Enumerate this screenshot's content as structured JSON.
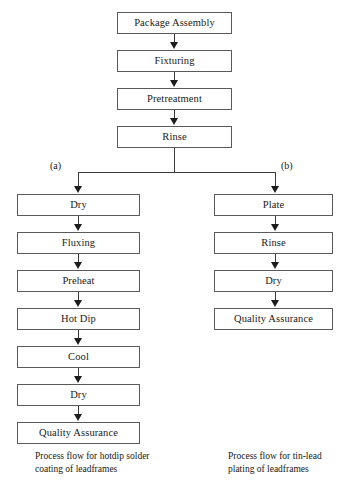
{
  "diagram": {
    "background": "#ffffff",
    "border_color": "#5a5a5a",
    "arrow_color": "#1c1c1c",
    "trunk": {
      "nodes": [
        {
          "label": "Package Assembly"
        },
        {
          "label": "Fixturing"
        },
        {
          "label": "Pretreatment"
        },
        {
          "label": "Rinse"
        }
      ]
    },
    "branches": [
      {
        "key": "a",
        "label": "(a)",
        "caption": "Process flow for hotdip solder\ncoating of leadframes",
        "nodes": [
          {
            "label": "Dry"
          },
          {
            "label": "Fluxing"
          },
          {
            "label": "Preheat"
          },
          {
            "label": "Hot Dip"
          },
          {
            "label": "Cool"
          },
          {
            "label": "Dry"
          },
          {
            "label": "Quality Assurance"
          }
        ]
      },
      {
        "key": "b",
        "label": "(b)",
        "caption": "Process flow for tin-lead\nplating of leadframes",
        "nodes": [
          {
            "label": "Plate"
          },
          {
            "label": "Rinse"
          },
          {
            "label": "Dry"
          },
          {
            "label": "Quality Assurance"
          }
        ]
      }
    ]
  }
}
